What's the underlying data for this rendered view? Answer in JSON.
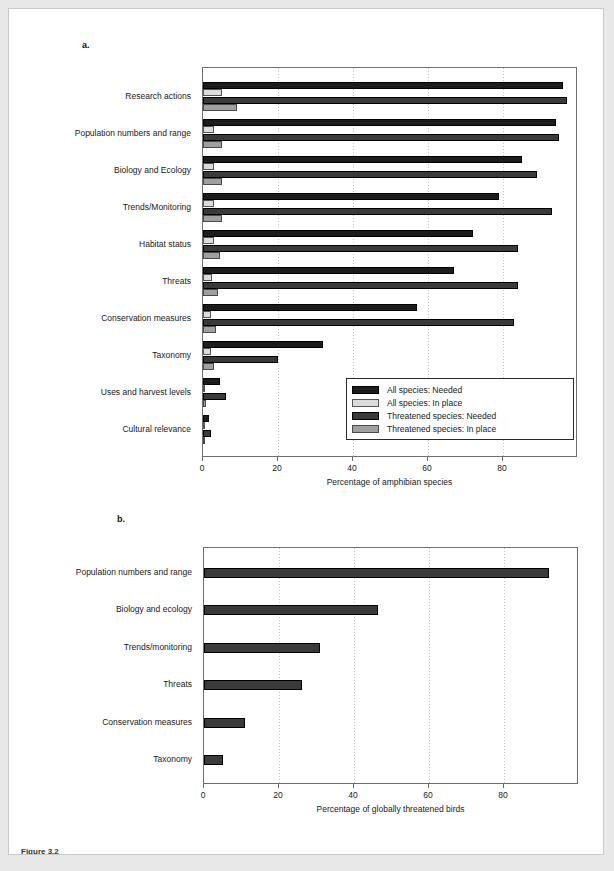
{
  "page": {
    "panel_a_letter": "a.",
    "panel_b_letter": "b.",
    "caption": "Figure 3.2"
  },
  "legend": {
    "items": [
      {
        "label": "All species: Needed",
        "color": "#1c1c1c"
      },
      {
        "label": "All species: In place",
        "color": "#dcdcdc"
      },
      {
        "label": "Threatened species: Needed",
        "color": "#3a3a3a"
      },
      {
        "label": "Threatened species: In place",
        "color": "#a0a0a0"
      }
    ]
  },
  "chart_data": [
    {
      "type": "bar",
      "orientation": "horizontal",
      "panel": "a",
      "title": "",
      "xlabel": "Percentage of amphibian species",
      "ylabel": "",
      "xlim": [
        0,
        100
      ],
      "xticks": [
        0,
        20,
        40,
        60,
        80
      ],
      "xticklabels": [
        "0",
        "20",
        "40",
        "60",
        "80"
      ],
      "grid": true,
      "legend_position": "lower right",
      "categories": [
        "Research actions",
        "Population numbers and range",
        "Biology and Ecology",
        "Trends/Monitoring",
        "Habitat status",
        "Threats",
        "Conservation measures",
        "Taxonomy",
        "Uses and harvest levels",
        "Cultural relevance"
      ],
      "series": [
        {
          "name": "All species: Needed",
          "values": [
            96,
            94,
            85,
            79,
            72,
            67,
            57,
            32,
            4.5,
            1.5
          ]
        },
        {
          "name": "All species: In place",
          "values": [
            5,
            3,
            3,
            3,
            3,
            2.5,
            2,
            2,
            0.5,
            0.3
          ]
        },
        {
          "name": "Threatened species: Needed",
          "values": [
            97,
            95,
            89,
            93,
            84,
            84,
            83,
            20,
            6,
            2
          ]
        },
        {
          "name": "Threatened species: In place",
          "values": [
            9,
            5,
            5,
            5,
            4.5,
            4,
            3.5,
            3,
            0.8,
            0.5
          ]
        }
      ]
    },
    {
      "type": "bar",
      "orientation": "horizontal",
      "panel": "b",
      "title": "",
      "xlabel": "Percentage of globally threatened birds",
      "ylabel": "",
      "xlim": [
        0,
        100
      ],
      "xticks": [
        0,
        20,
        40,
        60,
        80
      ],
      "xticklabels": [
        "0",
        "20",
        "40",
        "60",
        "80"
      ],
      "grid": true,
      "legend_position": "none",
      "categories": [
        "Population numbers and range",
        "Biology and ecology",
        "Trends/monitoring",
        "Threats",
        "Conservation measures",
        "Taxonomy"
      ],
      "series": [
        {
          "name": "Globally threatened birds",
          "values": [
            92,
            46.5,
            31,
            26,
            11,
            5
          ]
        }
      ]
    }
  ]
}
